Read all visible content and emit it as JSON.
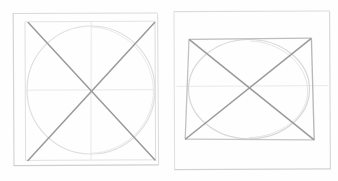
{
  "document": {
    "title": "Perspective construction sketch",
    "medium": "pencil on paper scan",
    "background_color": "#fefefe",
    "panel_count": 2
  },
  "palette": {
    "paper": "#fefefe",
    "frame_line": "#d9d9d9",
    "construction_line": "#e8e8e8",
    "curve_line": "#dcdcdc",
    "diagonal_line": "#9a9a9a",
    "box_edge": "#b9b9b9",
    "shadow_line": "#cfcfcf"
  },
  "panels": [
    {
      "id": "panel-left",
      "name": "square-with-inscribed-circle",
      "description": "Front-view square containing an inscribed circle, two corner-to-corner diagonals and faint horizontal and vertical center axes",
      "outer_frame": {
        "x": 12,
        "y": 13,
        "width": 145,
        "height": 153
      },
      "inner_square": {
        "x": 24,
        "y": 21,
        "width": 131,
        "height": 140
      },
      "circle": {
        "cx": 91,
        "cy": 90,
        "r": 64
      },
      "diagonals": [
        {
          "x1": 28,
          "y1": 22,
          "x2": 155,
          "y2": 160
        },
        {
          "x1": 155,
          "y1": 22,
          "x2": 28,
          "y2": 160
        }
      ],
      "axes": [
        {
          "type": "horizontal",
          "x1": 27,
          "y1": 90,
          "x2": 155,
          "y2": 90
        },
        {
          "type": "vertical",
          "x1": 91,
          "y1": 21,
          "x2": 91,
          "y2": 160
        }
      ]
    },
    {
      "id": "panel-right",
      "name": "rectangle-with-inscribed-ellipse",
      "description": "Slightly tilted rectangle in perspective containing an inscribed ellipse, two corner-to-corner diagonals and a faint horizon line",
      "outer_frame": {
        "x": 173,
        "y": 11,
        "width": 157,
        "height": 159
      },
      "inner_quad": [
        {
          "x": 189,
          "y": 39
        },
        {
          "x": 311,
          "y": 38
        },
        {
          "x": 314,
          "y": 140
        },
        {
          "x": 185,
          "y": 139
        }
      ],
      "ellipse": {
        "cx": 249,
        "cy": 89,
        "rx": 60,
        "ry": 50
      },
      "diagonals": [
        {
          "x1": 189,
          "y1": 39,
          "x2": 314,
          "y2": 140
        },
        {
          "x1": 311,
          "y1": 38,
          "x2": 185,
          "y2": 139
        }
      ],
      "axes": [
        {
          "type": "horizontal",
          "x1": 176,
          "y1": 86,
          "x2": 328,
          "y2": 86
        }
      ]
    }
  ]
}
